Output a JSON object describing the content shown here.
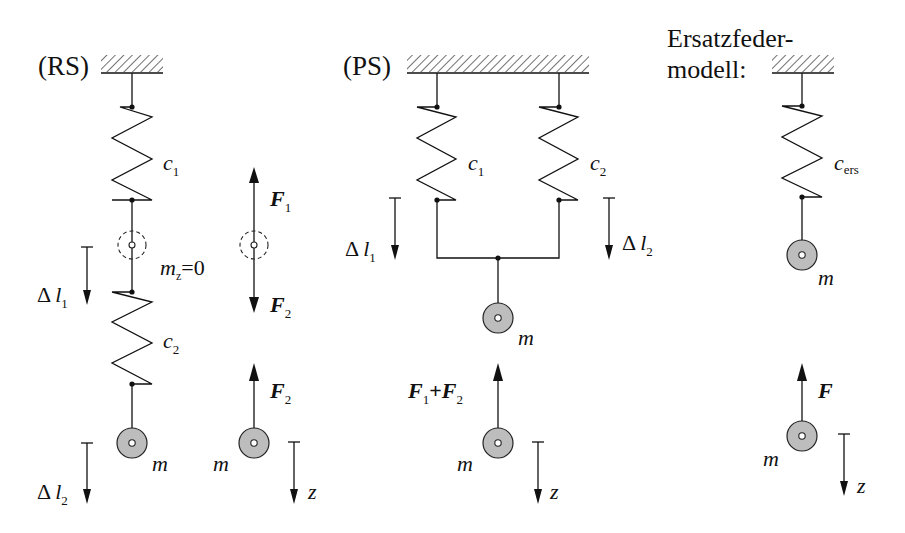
{
  "figure": {
    "panels": {
      "rs": {
        "title": "(RS)",
        "spring1": {
          "symbol": "c",
          "sub": "1"
        },
        "spring2": {
          "symbol": "c",
          "sub": "2"
        },
        "intermediate_mass": {
          "symbol": "m",
          "sub": "z",
          "rest": "=0"
        },
        "force_up": {
          "symbol": "F",
          "sub": "1"
        },
        "force_down": {
          "symbol": "F",
          "sub": "2"
        },
        "force_on_mass": {
          "symbol": "F",
          "sub": "2"
        },
        "disp1": {
          "symbol": "Δ",
          "var": "l",
          "sub": "1"
        },
        "disp2": {
          "symbol": "Δ",
          "var": "l",
          "sub": "2"
        },
        "mass": "m",
        "mass_fb": "m",
        "axis": "z"
      },
      "ps": {
        "title": "(PS)",
        "spring1": {
          "symbol": "c",
          "sub": "1"
        },
        "spring2": {
          "symbol": "c",
          "sub": "2"
        },
        "disp1": {
          "symbol": "Δ",
          "var": "l",
          "sub": "1"
        },
        "disp2": {
          "symbol": "Δ",
          "var": "l",
          "sub": "2"
        },
        "mass": "m",
        "mass_fb": "m",
        "force": {
          "a": "F",
          "a_sub": "1",
          "plus": "+",
          "b": "F",
          "b_sub": "2"
        },
        "axis": "z"
      },
      "ers": {
        "title_line1": "Ersatzfeder-",
        "title_line2": "modell:",
        "spring": {
          "symbol": "c",
          "sub": "ers"
        },
        "mass": "m",
        "mass_fb": "m",
        "force": "F",
        "axis": "z"
      }
    }
  }
}
